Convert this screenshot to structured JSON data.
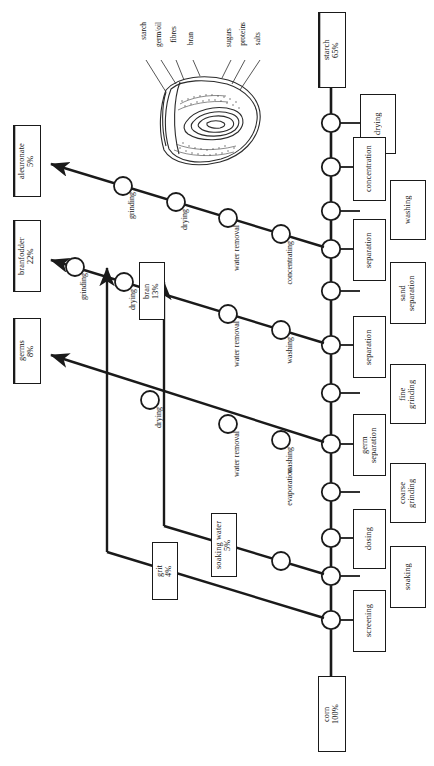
{
  "diagram": {
    "orientation": "rotated-90",
    "colors": {
      "line": "#1a1a1a",
      "box_border": "#1a1a1a",
      "background": "#ffffff",
      "text": "#111111"
    }
  },
  "kernel": {
    "name": "corn-kernel-illustration",
    "labels": [
      {
        "id": "starch",
        "text": "starch"
      },
      {
        "id": "germoil",
        "text": "germ/oil"
      },
      {
        "id": "fibres",
        "text": "fibres"
      },
      {
        "id": "bran",
        "text": "bran"
      },
      {
        "id": "sugars",
        "text": "sugars"
      },
      {
        "id": "proteins",
        "text": "proteins"
      },
      {
        "id": "salts",
        "text": "salts"
      }
    ]
  },
  "input_box": {
    "id": "corn",
    "name": "corn",
    "percent": "100%",
    "text": "corn\n100%"
  },
  "product_boxes": [
    {
      "id": "starch",
      "name": "starch",
      "percent": "65%",
      "text": "starch\n65%",
      "double_border": true
    },
    {
      "id": "aleuronate",
      "name": "aleuronate",
      "percent": "5%",
      "text": "aleuronate\n5%",
      "double_border": true
    },
    {
      "id": "branfodder",
      "name": "branfodder",
      "percent": "22%",
      "text": "branfodder\n22%",
      "double_border": true
    },
    {
      "id": "germs",
      "name": "germs",
      "percent": "8%",
      "text": "germs\n8%",
      "double_border": true
    }
  ],
  "intermediate_boxes": [
    {
      "id": "bran",
      "name": "bran",
      "percent": "13%",
      "text": "bran\n13%"
    },
    {
      "id": "soaking_water",
      "name": "soaking water",
      "percent": "5%",
      "text": "soaking water\n5%"
    },
    {
      "id": "grit",
      "name": "grit",
      "percent": "4%",
      "text": "grit\n4%"
    }
  ],
  "process_boxes": [
    {
      "id": "drying",
      "text": "drying"
    },
    {
      "id": "concentration",
      "text": "concentration"
    },
    {
      "id": "washing",
      "text": "washing"
    },
    {
      "id": "separation_1",
      "text": "separation"
    },
    {
      "id": "sand_separation",
      "text": "sand\nseparation"
    },
    {
      "id": "separation_2",
      "text": "separation"
    },
    {
      "id": "fine_grinding",
      "text": "fine\ngrinding"
    },
    {
      "id": "germ_separation",
      "text": "germ\nseparation"
    },
    {
      "id": "coarse_grinding",
      "text": "coarse\ngrinding"
    },
    {
      "id": "dosing",
      "text": "dosing"
    },
    {
      "id": "soaking",
      "text": "soaking"
    },
    {
      "id": "screening",
      "text": "screening"
    }
  ],
  "branch_labels": {
    "aleuronate_line": [
      {
        "id": "grinding",
        "text": "grinding"
      },
      {
        "id": "drying",
        "text": "drying"
      },
      {
        "id": "water_removal",
        "text": "water removal"
      },
      {
        "id": "concentrating",
        "text": "concentrating"
      }
    ],
    "branfodder_line": [
      {
        "id": "grinding",
        "text": "grinding"
      },
      {
        "id": "drying",
        "text": "drying"
      },
      {
        "id": "water_removal",
        "text": "water removal"
      },
      {
        "id": "washing",
        "text": "washing"
      }
    ],
    "germs_line": [
      {
        "id": "drying",
        "text": "drying"
      },
      {
        "id": "water_removal",
        "text": "water removal"
      },
      {
        "id": "washing",
        "text": "washing"
      }
    ],
    "soaking_water_line": [
      {
        "id": "evaporation",
        "text": "evaporation"
      }
    ]
  }
}
